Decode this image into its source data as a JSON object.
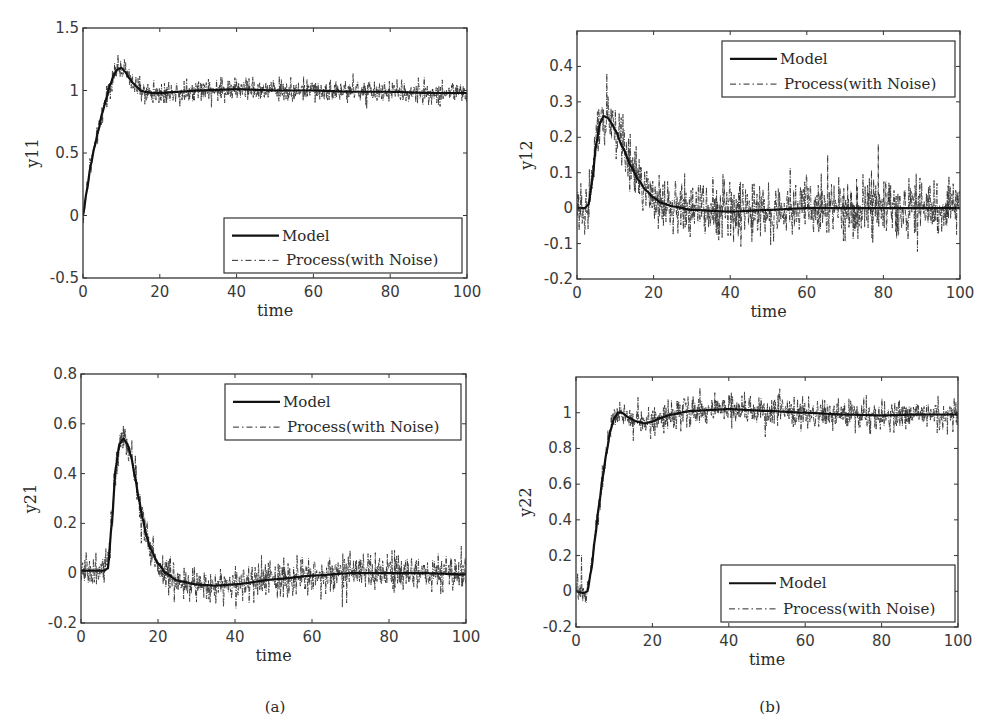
{
  "figure": {
    "captions": [
      "(a)",
      "(b)"
    ],
    "legend": {
      "model_label": "Model",
      "process_label": "Process(with Noise)"
    },
    "colors": {
      "model_line": "#111111",
      "process_line": "#2b2b2b",
      "axes": "#333333",
      "background": "#ffffff"
    }
  },
  "chart_data": [
    {
      "id": "y11",
      "type": "line",
      "title": "",
      "xlabel": "time",
      "ylabel": "y11",
      "xlim": [
        0,
        100
      ],
      "ylim": [
        -0.5,
        1.5
      ],
      "xticks": [
        0,
        20,
        40,
        60,
        80,
        100
      ],
      "yticks": [
        -0.5,
        0,
        0.5,
        1,
        1.5
      ],
      "ytick_labels": [
        "-0.5",
        "0",
        "0.5",
        "1",
        "1.5"
      ],
      "grid": false,
      "legend_position": "lower right",
      "frame": {
        "left": 83,
        "top": 28,
        "right": 467,
        "bottom": 278
      },
      "legend_box": {
        "left": 224,
        "top": 218,
        "right": 462,
        "bottom": 273
      },
      "noise_amplitude": 0.055,
      "series": [
        {
          "name": "Model",
          "style": "solid",
          "x": [
            0,
            1,
            2,
            3,
            4,
            5,
            6,
            7,
            8,
            9,
            10,
            11,
            12,
            13,
            14,
            15,
            16,
            18,
            20,
            25,
            30,
            40,
            50,
            60,
            70,
            80,
            90,
            100
          ],
          "y": [
            0,
            0.2,
            0.4,
            0.55,
            0.68,
            0.82,
            0.93,
            1.04,
            1.12,
            1.17,
            1.18,
            1.15,
            1.1,
            1.06,
            1.03,
            1.0,
            0.99,
            0.98,
            0.98,
            0.99,
            1.0,
            1.01,
            1.0,
            1.0,
            0.99,
            0.99,
            0.98,
            0.98
          ]
        },
        {
          "name": "Process(with Noise)",
          "style": "dashdot",
          "note": "Model response plus measurement noise (approx. ±0.1)"
        }
      ]
    },
    {
      "id": "y12",
      "type": "line",
      "title": "",
      "xlabel": "time",
      "ylabel": "y12",
      "xlim": [
        0,
        100
      ],
      "ylim": [
        -0.2,
        0.5
      ],
      "xticks": [
        0,
        20,
        40,
        60,
        80,
        100
      ],
      "yticks": [
        -0.2,
        -0.1,
        0,
        0.1,
        0.2,
        0.3,
        0.4
      ],
      "ytick_labels": [
        "-0.2",
        "-0.1",
        "0",
        "0.1",
        "0.2",
        "0.3",
        "0.4"
      ],
      "grid": false,
      "legend_position": "upper right",
      "frame": {
        "left": 577,
        "top": 31,
        "right": 960,
        "bottom": 279
      },
      "legend_box": {
        "left": 722,
        "top": 41,
        "right": 955,
        "bottom": 97
      },
      "noise_amplitude": 0.05,
      "series": [
        {
          "name": "Model",
          "style": "solid",
          "x": [
            0,
            2,
            3,
            4,
            5,
            6,
            7,
            8,
            9,
            10,
            12,
            14,
            16,
            18,
            20,
            22,
            25,
            30,
            40,
            50,
            60,
            70,
            80,
            90,
            100
          ],
          "y": [
            0,
            0,
            0.01,
            0.08,
            0.18,
            0.24,
            0.26,
            0.255,
            0.24,
            0.22,
            0.17,
            0.12,
            0.08,
            0.05,
            0.03,
            0.015,
            0.005,
            -0.005,
            -0.01,
            -0.005,
            0,
            0,
            0,
            0,
            0
          ]
        },
        {
          "name": "Process(with Noise)",
          "style": "dashdot",
          "note": "Model response plus measurement noise (approx. ±0.12)"
        }
      ]
    },
    {
      "id": "y21",
      "type": "line",
      "title": "",
      "xlabel": "time",
      "ylabel": "y21",
      "xlim": [
        0,
        100
      ],
      "ylim": [
        -0.2,
        0.8
      ],
      "xticks": [
        0,
        20,
        40,
        60,
        80,
        100
      ],
      "yticks": [
        -0.2,
        0,
        0.2,
        0.4,
        0.6,
        0.8
      ],
      "ytick_labels": [
        "-0.2",
        "0",
        "0.2",
        "0.4",
        "0.6",
        "0.8"
      ],
      "grid": false,
      "legend_position": "upper right",
      "frame": {
        "left": 81,
        "top": 374,
        "right": 466,
        "bottom": 623
      },
      "legend_box": {
        "left": 225,
        "top": 384,
        "right": 461,
        "bottom": 440
      },
      "noise_amplitude": 0.045,
      "series": [
        {
          "name": "Model",
          "style": "solid",
          "x": [
            0,
            5,
            6,
            7,
            8,
            9,
            10,
            11,
            12,
            13,
            14,
            15,
            16,
            17,
            18,
            20,
            22,
            25,
            30,
            35,
            40,
            50,
            60,
            70,
            80,
            90,
            100
          ],
          "y": [
            0.01,
            0.01,
            0.01,
            0.02,
            0.2,
            0.42,
            0.52,
            0.54,
            0.52,
            0.47,
            0.39,
            0.3,
            0.22,
            0.15,
            0.1,
            0.04,
            0.0,
            -0.03,
            -0.045,
            -0.05,
            -0.045,
            -0.025,
            -0.01,
            0.0,
            0.0,
            0.0,
            -0.005
          ]
        },
        {
          "name": "Process(with Noise)",
          "style": "dashdot",
          "note": "Model response plus measurement noise (approx. ±0.12)"
        }
      ]
    },
    {
      "id": "y22",
      "type": "line",
      "title": "",
      "xlabel": "time",
      "ylabel": "y22",
      "xlim": [
        0,
        100
      ],
      "ylim": [
        -0.2,
        1.2
      ],
      "xticks": [
        0,
        20,
        40,
        60,
        80,
        100
      ],
      "yticks": [
        -0.2,
        0,
        0.2,
        0.4,
        0.6,
        0.8,
        1
      ],
      "ytick_labels": [
        "-0.2",
        "0",
        "0.2",
        "0.4",
        "0.6",
        "0.8",
        "1"
      ],
      "grid": false,
      "legend_position": "lower right",
      "frame": {
        "left": 576,
        "top": 377,
        "right": 958,
        "bottom": 627
      },
      "legend_box": {
        "left": 721,
        "top": 565,
        "right": 955,
        "bottom": 622
      },
      "noise_amplitude": 0.05,
      "series": [
        {
          "name": "Model",
          "style": "solid",
          "x": [
            0,
            2,
            3,
            4,
            5,
            6,
            7,
            8,
            9,
            10,
            11,
            12,
            14,
            16,
            18,
            20,
            22,
            25,
            30,
            40,
            50,
            60,
            70,
            80,
            90,
            100
          ],
          "y": [
            0,
            -0.01,
            0.0,
            0.12,
            0.3,
            0.48,
            0.64,
            0.78,
            0.9,
            0.97,
            1.0,
            1.0,
            0.97,
            0.95,
            0.94,
            0.95,
            0.97,
            0.99,
            1.01,
            1.02,
            1.01,
            1.0,
            0.99,
            0.985,
            0.99,
            0.99
          ]
        },
        {
          "name": "Process(with Noise)",
          "style": "dashdot",
          "note": "Model response plus measurement noise (approx. ±0.12)"
        }
      ]
    }
  ]
}
